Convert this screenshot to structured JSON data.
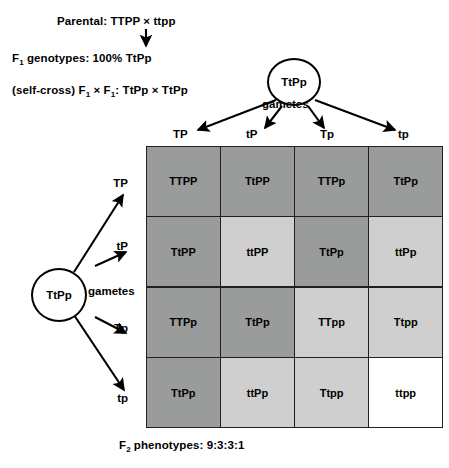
{
  "header": {
    "parental_label": "Parental:",
    "parental_cross": "TTPP × ttpp",
    "parental_full": "Parental: TTPP × ttpp",
    "f1_label": "F",
    "f1_sub": "1",
    "f1_text": " genotypes: 100%   TtPp",
    "selfcross_prefix": "(self-cross) F",
    "selfcross_sub1": "1",
    "selfcross_mid": " × F",
    "selfcross_sub2": "1",
    "selfcross_suffix": ": TtPp × TtPp"
  },
  "top_gamete": {
    "genotype": "TtPp",
    "gametes_label": "gametes"
  },
  "left_gamete": {
    "genotype": "TtPp",
    "gametes_label": "gametes"
  },
  "columns": [
    "TP",
    "tP",
    "Tp",
    "tp"
  ],
  "rows": [
    "TP",
    "tP",
    "Tp",
    "tp"
  ],
  "grid": [
    [
      {
        "genotype": "TTPP",
        "shade": "dark"
      },
      {
        "genotype": "TtPP",
        "shade": "dark"
      },
      {
        "genotype": "TTPp",
        "shade": "dark"
      },
      {
        "genotype": "TtPp",
        "shade": "dark"
      }
    ],
    [
      {
        "genotype": "TtPP",
        "shade": "dark"
      },
      {
        "genotype": "ttPP",
        "shade": "light"
      },
      {
        "genotype": "TtPp",
        "shade": "dark"
      },
      {
        "genotype": "ttPp",
        "shade": "light"
      }
    ],
    [
      {
        "genotype": "TTPp",
        "shade": "dark"
      },
      {
        "genotype": "TtPp",
        "shade": "dark"
      },
      {
        "genotype": "TTpp",
        "shade": "light"
      },
      {
        "genotype": "Ttpp",
        "shade": "light"
      }
    ],
    [
      {
        "genotype": "TtPp",
        "shade": "dark"
      },
      {
        "genotype": "ttPp",
        "shade": "light"
      },
      {
        "genotype": "Ttpp",
        "shade": "light"
      },
      {
        "genotype": "ttpp",
        "shade": "white"
      }
    ]
  ],
  "caption": {
    "prefix": "F",
    "sub": "2",
    "text": " phenotypes: 9:3:3:1"
  },
  "colors": {
    "dark_shade": "#9a9b9b",
    "light_shade": "#cfcfcf",
    "white_shade": "#ffffff",
    "line": "#231f20",
    "text": "#000000"
  }
}
